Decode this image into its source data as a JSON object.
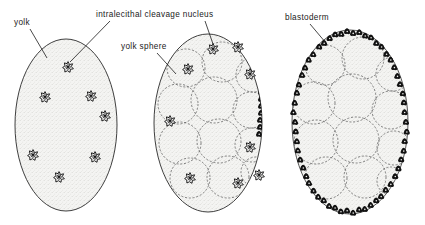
{
  "figure": {
    "type": "biological-diagram",
    "panel_count": 3,
    "background_color": "#ffffff",
    "ink_color": "#1a1a1a",
    "yolk_fill_color": "#f2f2f0",
    "blastoderm_color": "#1a1a1a"
  },
  "labels": [
    {
      "id": "yolk",
      "text": "yolk",
      "x": 14,
      "y": 25,
      "leader_from": [
        30,
        29
      ],
      "leader_to": [
        47,
        58
      ],
      "panel": 1
    },
    {
      "id": "intralecithal-cleavage-nucleus",
      "text": "intralecithal  cleavage  nucleus",
      "x": 96,
      "y": 17,
      "leader_from": [
        110,
        21
      ],
      "leader_to": [
        70,
        66
      ],
      "leader_from_2": [
        205,
        21
      ],
      "leader_to_2": [
        213,
        48
      ],
      "panel": "1 and 2"
    },
    {
      "id": "yolk-sphere",
      "text": "yolk  sphere",
      "x": 121,
      "y": 49,
      "leader_from": [
        157,
        53
      ],
      "leader_to": [
        174,
        72
      ],
      "panel": 2
    },
    {
      "id": "blastoderm",
      "text": "blastoderm",
      "x": 285,
      "y": 20,
      "leader_from": [
        310,
        24
      ],
      "leader_to": [
        325,
        42
      ],
      "panel": 3
    }
  ],
  "panels": [
    {
      "index": 1,
      "name": "uncleaved-centrolecithal-egg",
      "stage": "early cleavage — free intralecithal nuclei dispersed in yolk",
      "egg": {
        "cx": 66,
        "cy": 125,
        "rx": 51,
        "ry": 86
      },
      "has_yolk_spheres": false,
      "has_blastoderm": false,
      "nuclei": [
        [
          68,
          67
        ],
        [
          45,
          97
        ],
        [
          91,
          96
        ],
        [
          105,
          116
        ],
        [
          33,
          155
        ],
        [
          95,
          157
        ],
        [
          59,
          177
        ]
      ]
    },
    {
      "index": 2,
      "name": "yolk-sphere-stage-egg",
      "stage": "nuclei migrating outward; yolk partitioned into yolk spheres",
      "egg": {
        "cx": 208,
        "cy": 123,
        "rx": 54,
        "ry": 89
      },
      "has_yolk_spheres": true,
      "has_blastoderm": false,
      "nuclei": [
        [
          213,
          49
        ],
        [
          238,
          47
        ],
        [
          188,
          69
        ],
        [
          250,
          74
        ],
        [
          170,
          121
        ],
        [
          250,
          147
        ],
        [
          190,
          178
        ],
        [
          259,
          175
        ],
        [
          238,
          183
        ]
      ],
      "yolk_spheres": [
        [
          186,
          68,
          19
        ],
        [
          222,
          62,
          20
        ],
        [
          253,
          75,
          17
        ],
        [
          178,
          104,
          20
        ],
        [
          214,
          100,
          23
        ],
        [
          251,
          110,
          18
        ],
        [
          180,
          143,
          21
        ],
        [
          219,
          141,
          22
        ],
        [
          252,
          145,
          17
        ],
        [
          190,
          178,
          20
        ],
        [
          228,
          177,
          21
        ],
        [
          256,
          172,
          15
        ]
      ]
    },
    {
      "index": 3,
      "name": "blastoderm-stage-egg",
      "stage": "nuclei reached the surface and formed a peripheral blastoderm",
      "egg": {
        "cx": 350,
        "cy": 122,
        "rx": 58,
        "ry": 92
      },
      "has_yolk_spheres": true,
      "has_blastoderm": true,
      "nuclei": [],
      "blastoderm_cell_count": 58,
      "yolk_spheres": [
        [
          325,
          65,
          20
        ],
        [
          363,
          58,
          21
        ],
        [
          393,
          74,
          17
        ],
        [
          314,
          103,
          21
        ],
        [
          352,
          98,
          24
        ],
        [
          391,
          110,
          19
        ],
        [
          316,
          142,
          22
        ],
        [
          356,
          140,
          23
        ],
        [
          394,
          148,
          17
        ],
        [
          326,
          178,
          21
        ],
        [
          365,
          177,
          21
        ],
        [
          391,
          181,
          14
        ]
      ]
    }
  ]
}
